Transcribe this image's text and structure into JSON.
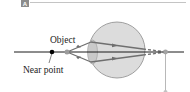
{
  "figure": {
    "panel_label": "A",
    "labels": {
      "object": "Object",
      "near_point": "Near point"
    },
    "colors": {
      "axis": "#1a1a1a",
      "eye_fill": "#d9d9d9",
      "eye_stroke": "#7a7a7a",
      "lens_fill": "#c8c8c8",
      "ray": "#6e6e6e",
      "near_point_dot": "#000000",
      "object_dot": "#9a9a9a",
      "image_dot": "#a0a0a0",
      "image_line": "#b5b5b5",
      "badge": "#8c8c8c",
      "divider": "#bdbdbd"
    },
    "elements": [
      "optical-axis",
      "near-point-marker",
      "object-point",
      "eye",
      "lens",
      "rays",
      "image-point",
      "image-drop-line"
    ]
  }
}
